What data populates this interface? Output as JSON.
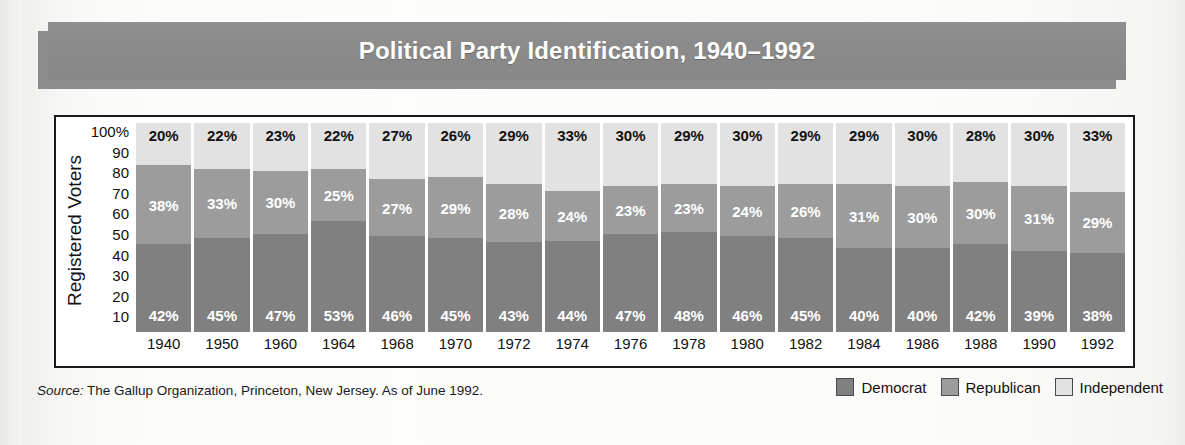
{
  "title": "Political Party Identification, 1940–1992",
  "chart_data": {
    "type": "bar",
    "stacked": true,
    "title": "Political Party Identification, 1940–1992",
    "xlabel": "",
    "ylabel": "Registered Voters",
    "ylim": [
      0,
      100
    ],
    "ytick_labels": [
      "100%",
      "90",
      "80",
      "70",
      "60",
      "50",
      "40",
      "30",
      "20",
      "10"
    ],
    "grid": false,
    "legend_position": "bottom-right",
    "categories": [
      "1940",
      "1950",
      "1960",
      "1964",
      "1968",
      "1970",
      "1972",
      "1974",
      "1976",
      "1978",
      "1980",
      "1982",
      "1984",
      "1986",
      "1988",
      "1990",
      "1992"
    ],
    "series": [
      {
        "name": "Democrat",
        "color": "#808080",
        "values": [
          42,
          45,
          47,
          53,
          46,
          45,
          43,
          44,
          47,
          48,
          46,
          45,
          40,
          40,
          42,
          39,
          38
        ],
        "labels": [
          "42%",
          "45%",
          "47%",
          "53%",
          "46%",
          "45%",
          "43%",
          "44%",
          "47%",
          "48%",
          "46%",
          "45%",
          "40%",
          "40%",
          "42%",
          "39%",
          "38%"
        ]
      },
      {
        "name": "Republican",
        "color": "#9c9c9c",
        "values": [
          38,
          33,
          30,
          25,
          27,
          29,
          28,
          24,
          23,
          23,
          24,
          26,
          31,
          30,
          30,
          31,
          29
        ],
        "labels": [
          "38%",
          "33%",
          "30%",
          "25%",
          "27%",
          "29%",
          "28%",
          "24%",
          "23%",
          "23%",
          "24%",
          "26%",
          "31%",
          "30%",
          "30%",
          "31%",
          "29%"
        ]
      },
      {
        "name": "Independent",
        "color": "#e2e2e2",
        "values": [
          20,
          22,
          23,
          22,
          27,
          26,
          29,
          33,
          30,
          29,
          30,
          29,
          29,
          30,
          28,
          30,
          33
        ],
        "labels": [
          "20%",
          "22%",
          "23%",
          "22%",
          "27%",
          "26%",
          "29%",
          "33%",
          "30%",
          "29%",
          "30%",
          "29%",
          "29%",
          "30%",
          "28%",
          "30%",
          "33%"
        ]
      }
    ]
  },
  "legend": [
    {
      "label": "Democrat",
      "color": "#808080"
    },
    {
      "label": "Republican",
      "color": "#9c9c9c"
    },
    {
      "label": "Independent",
      "color": "#e2e2e2"
    }
  ],
  "footer": {
    "source_prefix": "Source:",
    "source_text": "The Gallup Organization, Princeton, New Jersey. As of June 1992."
  }
}
